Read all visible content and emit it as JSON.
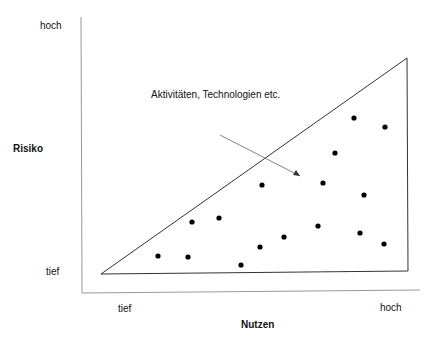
{
  "chart_data": {
    "type": "scatter",
    "title": "",
    "xlabel": "Nutzen",
    "ylabel": "Risiko",
    "x_ticks": [
      "tief",
      "hoch"
    ],
    "y_ticks": [
      "tief",
      "hoch"
    ],
    "annotation": "Aktivitäten, Technologien etc.",
    "shape": "triangle",
    "points": [
      {
        "x": 158,
        "y": 256
      },
      {
        "x": 188,
        "y": 257
      },
      {
        "x": 192,
        "y": 222
      },
      {
        "x": 219,
        "y": 218
      },
      {
        "x": 241,
        "y": 265
      },
      {
        "x": 260,
        "y": 247
      },
      {
        "x": 262,
        "y": 185
      },
      {
        "x": 284,
        "y": 237
      },
      {
        "x": 318,
        "y": 226
      },
      {
        "x": 323,
        "y": 183
      },
      {
        "x": 335,
        "y": 153
      },
      {
        "x": 354,
        "y": 118
      },
      {
        "x": 360,
        "y": 233
      },
      {
        "x": 364,
        "y": 195
      },
      {
        "x": 384,
        "y": 244
      },
      {
        "x": 385,
        "y": 127
      }
    ]
  },
  "labels": {
    "y_high": "hoch",
    "y_low": "tief",
    "y_axis": "Risiko",
    "x_low": "tief",
    "x_high": "hoch",
    "x_axis": "Nutzen",
    "annotation": "Aktivitäten, Technologien etc."
  }
}
